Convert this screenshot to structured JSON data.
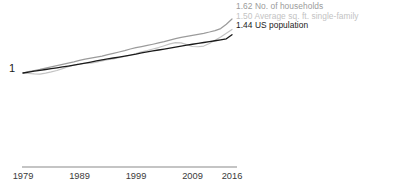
{
  "chart_data": {
    "type": "line",
    "title": "",
    "subtitle": "",
    "xlabel": "",
    "ylabel": "",
    "xlim": [
      1979,
      2016
    ],
    "ylim": [
      1.0,
      1.7
    ],
    "grid": false,
    "legend_position": "inline-right-end-labels",
    "y_base_label": "1",
    "x_ticks": [
      {
        "label": "1979",
        "value": 1979
      },
      {
        "label": "1989",
        "value": 1989
      },
      {
        "label": "1999",
        "value": 1999
      },
      {
        "label": "2009",
        "value": 2009
      },
      {
        "label": "2016",
        "value": 2016
      }
    ],
    "x": [
      1979,
      1980,
      1981,
      1982,
      1983,
      1984,
      1985,
      1986,
      1987,
      1988,
      1989,
      1990,
      1991,
      1992,
      1993,
      1994,
      1995,
      1996,
      1997,
      1998,
      1999,
      2000,
      2001,
      2002,
      2003,
      2004,
      2005,
      2006,
      2007,
      2008,
      2009,
      2010,
      2011,
      2012,
      2013,
      2014,
      2015,
      2016
    ],
    "series": [
      {
        "name": "No. of households",
        "end_value": 1.62,
        "end_label": "1.62 No. of households",
        "color": "#9b9b9b",
        "values": [
          1.0,
          1.015,
          1.029,
          1.041,
          1.055,
          1.07,
          1.084,
          1.099,
          1.114,
          1.128,
          1.145,
          1.16,
          1.171,
          1.182,
          1.193,
          1.21,
          1.226,
          1.241,
          1.256,
          1.275,
          1.291,
          1.303,
          1.316,
          1.33,
          1.345,
          1.36,
          1.378,
          1.394,
          1.408,
          1.42,
          1.432,
          1.444,
          1.455,
          1.47,
          1.487,
          1.51,
          1.56,
          1.62
        ]
      },
      {
        "name": "Average sq. ft. single-family",
        "end_value": 1.5,
        "end_label": "1.50 Average sq. ft. single-family",
        "color": "#c3c3c3",
        "values": [
          1.0,
          0.994,
          0.989,
          0.988,
          0.999,
          1.012,
          1.029,
          1.051,
          1.072,
          1.09,
          1.104,
          1.112,
          1.112,
          1.124,
          1.139,
          1.152,
          1.163,
          1.177,
          1.189,
          1.204,
          1.224,
          1.243,
          1.258,
          1.275,
          1.292,
          1.313,
          1.335,
          1.348,
          1.345,
          1.326,
          1.304,
          1.301,
          1.309,
          1.338,
          1.375,
          1.412,
          1.455,
          1.5
        ]
      },
      {
        "name": "US population",
        "end_value": 1.44,
        "end_label": "1.44 US population",
        "color": "#1a1a1a",
        "values": [
          1.0,
          1.011,
          1.021,
          1.031,
          1.04,
          1.05,
          1.06,
          1.07,
          1.08,
          1.09,
          1.101,
          1.114,
          1.126,
          1.138,
          1.15,
          1.161,
          1.172,
          1.183,
          1.194,
          1.205,
          1.217,
          1.231,
          1.243,
          1.254,
          1.264,
          1.275,
          1.286,
          1.298,
          1.309,
          1.32,
          1.33,
          1.34,
          1.35,
          1.36,
          1.37,
          1.381,
          1.392,
          1.44
        ]
      }
    ]
  },
  "axis": {
    "x_axis_color": "#8a8a8a"
  }
}
